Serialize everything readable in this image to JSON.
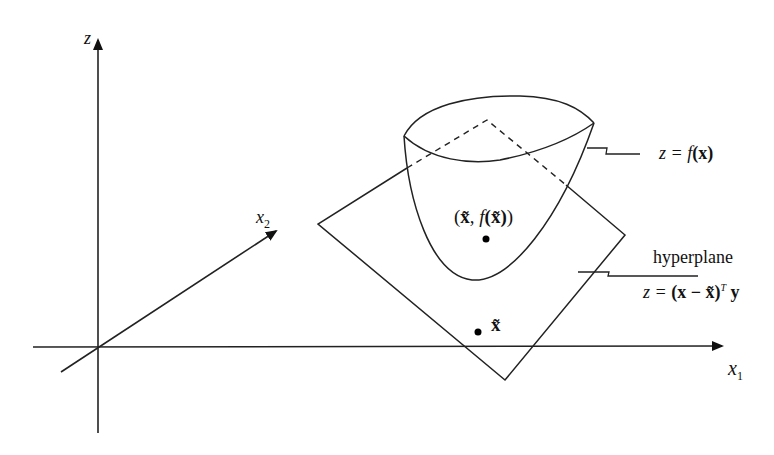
{
  "diagram": {
    "axes": {
      "z": {
        "label": "z"
      },
      "x1": {
        "label": "x",
        "subscript": "1"
      },
      "x2": {
        "label": "x",
        "subscript": "2"
      }
    },
    "surface": {
      "label_lhs": "z = ",
      "label_fn": "f",
      "label_arg": "(x)"
    },
    "hyperplane": {
      "title": "hyperplane",
      "eq_lhs": "z = ",
      "eq_paren": "(x − x̃)",
      "eq_sup": "T",
      "eq_rhs": " y"
    },
    "points": {
      "tangent_point": {
        "open": "(",
        "x": "x̃",
        "comma": ", ",
        "fn": "f",
        "arg": "(x̃)",
        "close": ")"
      },
      "base_point": {
        "label": "x̃"
      }
    },
    "colors": {
      "stroke": "#111111",
      "background": "#ffffff"
    }
  }
}
